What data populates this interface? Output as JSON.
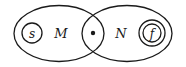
{
  "diagram": {
    "type": "state-machine-composition",
    "colors": {
      "stroke": "#1a1a1a",
      "background": "#ffffff"
    },
    "regions": [
      {
        "id": "M",
        "label": "M",
        "shape": "ellipse"
      },
      {
        "id": "N",
        "label": "N",
        "shape": "ellipse"
      }
    ],
    "states": [
      {
        "id": "s",
        "label": "s",
        "kind": "start",
        "region": "M"
      },
      {
        "id": "f",
        "label": "f",
        "kind": "final",
        "region": "N"
      }
    ],
    "junction": {
      "kind": "shared-state-dot",
      "between": [
        "M",
        "N"
      ]
    }
  }
}
